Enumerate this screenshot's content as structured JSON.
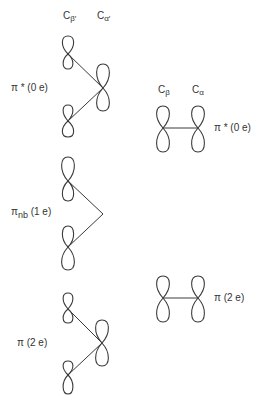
{
  "allyl_column": {
    "atom_labels": {
      "c_beta_prime": {
        "base": "C",
        "sub": "β′"
      },
      "c_alpha_prime": {
        "base": "C",
        "sub": "α′"
      }
    },
    "orbitals": [
      {
        "id": "pi-star",
        "label": "π * (0 e)"
      },
      {
        "id": "pi-nb",
        "label_main": "π",
        "label_sub": "nb",
        "label_tail": " (1 e)"
      },
      {
        "id": "pi",
        "label": "π (2 e)"
      }
    ]
  },
  "ethylene_column": {
    "atom_labels": {
      "c_beta": {
        "base": "C",
        "sub": "β"
      },
      "c_alpha": {
        "base": "C",
        "sub": "α"
      }
    },
    "orbitals": [
      {
        "id": "pi-star",
        "label": "π * (0 e)"
      },
      {
        "id": "pi",
        "label": "π (2 e)"
      }
    ]
  }
}
